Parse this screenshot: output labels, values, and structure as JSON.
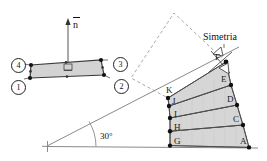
{
  "figure": {
    "title_hidden": "",
    "colors": {
      "fill": "#d9d9d9",
      "stroke": "#3a3a3a",
      "dashed": "#9a9a9a",
      "node": "#111111",
      "axis": "#777777",
      "text": "#111111"
    }
  },
  "left_element": {
    "name": "quadrilateral-element",
    "normal_vector": {
      "symbol": "n",
      "overbar": true
    },
    "nodes": [
      {
        "id": "1",
        "label": "1",
        "x": 11,
        "y": 80
      },
      {
        "id": "2",
        "label": "2",
        "x": 114,
        "y": 79
      },
      {
        "id": "3",
        "label": "3",
        "x": 113,
        "y": 60
      },
      {
        "id": "4",
        "label": "4",
        "x": 12,
        "y": 62
      }
    ],
    "vertices": [
      {
        "x": 30,
        "y": 78
      },
      {
        "x": 104,
        "y": 75
      },
      {
        "x": 101,
        "y": 60
      },
      {
        "x": 31,
        "y": 65
      }
    ],
    "midside_nodes": [
      {
        "x": 67,
        "y": 77
      },
      {
        "x": 103,
        "y": 68
      },
      {
        "x": 66,
        "y": 62
      },
      {
        "x": 31,
        "y": 71
      }
    ],
    "origin_marker": {
      "x": 68,
      "y": 68,
      "symbol": "square-origin"
    }
  },
  "right_assembly": {
    "name": "stacked-elements-30deg",
    "angle_label": "30°",
    "symmetry_label": "Simetria",
    "baseline": {
      "x1": 46,
      "y1": 146,
      "x2": 258,
      "y2": 148
    },
    "origin_cross": {
      "x": 47,
      "y": 146
    },
    "inclined_line": {
      "x1": 47,
      "y1": 146,
      "x2": 236,
      "y2": 49
    },
    "left_edge_points": [
      {
        "label": "G",
        "x": 170,
        "y": 145
      },
      {
        "label": "H",
        "x": 170,
        "y": 131
      },
      {
        "label": "I",
        "x": 170,
        "y": 118
      },
      {
        "label": "J",
        "x": 169,
        "y": 106
      },
      {
        "label": "K",
        "x": 168,
        "y": 98
      }
    ],
    "right_edge_points": [
      {
        "label": "A",
        "x": 249,
        "y": 147
      },
      {
        "label": "C",
        "x": 243,
        "y": 125
      },
      {
        "label": "D",
        "x": 237,
        "y": 105
      },
      {
        "label": "E",
        "x": 231,
        "y": 85
      },
      {
        "label": "F",
        "x": 226,
        "y": 62
      }
    ],
    "layers": [
      {
        "name": "layer-GA",
        "left_bottom": "G",
        "left_top": "H",
        "right_bottom": "A",
        "right_top": "C"
      },
      {
        "name": "layer-HC",
        "left_bottom": "H",
        "left_top": "I",
        "right_bottom": "C",
        "right_top": "D"
      },
      {
        "name": "layer-ID",
        "left_bottom": "I",
        "left_top": "J",
        "right_bottom": "D",
        "right_top": "E"
      },
      {
        "name": "layer-JE",
        "left_bottom": "J",
        "left_top": "K",
        "right_bottom": "E",
        "right_top": "F"
      }
    ],
    "dashed_mirror": {
      "name": "mirrored-copy",
      "points": [
        {
          "x": 226,
          "y": 62
        },
        {
          "x": 174,
          "y": 13
        },
        {
          "x": 131,
          "y": 78
        },
        {
          "x": 168,
          "y": 98
        }
      ]
    },
    "symmetry_symbol": {
      "x": 218,
      "y": 58,
      "type": "bowtie-marker"
    }
  }
}
